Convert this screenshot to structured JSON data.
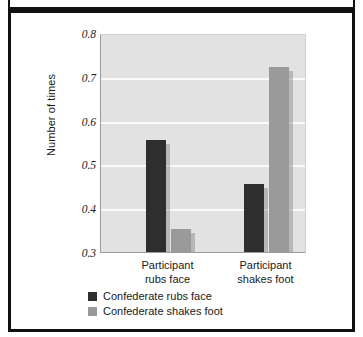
{
  "figure": {
    "frame_color": "#111111",
    "plot_background": "#e2e2e2",
    "gridline_color": "#fafafa"
  },
  "chart_data": {
    "type": "bar",
    "title": "",
    "subtitle": "",
    "xlabel": "",
    "ylabel": "Number of times",
    "categories": [
      "Participant rubs face",
      "Participant shakes foot"
    ],
    "category_lines": [
      [
        "Participant",
        "rubs face"
      ],
      [
        "Participant",
        "shakes foot"
      ]
    ],
    "series": [
      {
        "name": "Confederate rubs face",
        "color": "#2e2e2e",
        "values": [
          0.556,
          0.455
        ]
      },
      {
        "name": "Confederate shakes foot",
        "color": "#9a9a9a",
        "values": [
          0.353,
          0.722
        ]
      }
    ],
    "ylim": [
      0.3,
      0.8
    ],
    "ytick_values": [
      0.3,
      0.4,
      0.5,
      0.6,
      0.7,
      0.8
    ],
    "ytick_labels": [
      "0.3",
      "0.4",
      "0.5",
      "0.6",
      "0.7",
      "0.8"
    ],
    "grid": "horizontal",
    "legend_position": "bottom-left",
    "annotations": []
  },
  "legend": {
    "items": [
      {
        "label": "Confederate rubs face",
        "color": "#2e2e2e"
      },
      {
        "label": "Confederate shakes foot",
        "color": "#9a9a9a"
      }
    ]
  }
}
